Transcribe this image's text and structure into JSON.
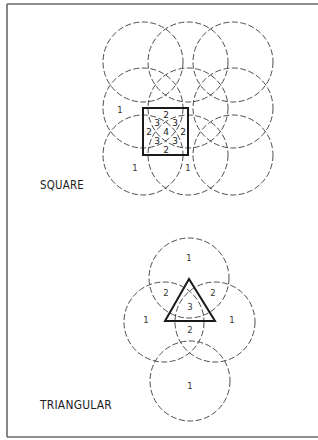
{
  "figure": {
    "width": 318,
    "height": 440,
    "frame": {
      "left": 7,
      "top": 4,
      "right": 318,
      "bottom": 437
    },
    "colors": {
      "circle": "#3a3a3a",
      "shape": "#1a1a1a",
      "frame": "#6a6a6a",
      "text": "#1e1e1e"
    }
  },
  "patterns": [
    {
      "id": "square",
      "title": "SQUARE",
      "title_pos": {
        "x": 40,
        "y": 189
      },
      "circle_radius": 40,
      "circles": [
        {
          "cx": 143,
          "cy": 62
        },
        {
          "cx": 188,
          "cy": 62
        },
        {
          "cx": 233,
          "cy": 62
        },
        {
          "cx": 143,
          "cy": 108
        },
        {
          "cx": 188,
          "cy": 108
        },
        {
          "cx": 233,
          "cy": 108
        },
        {
          "cx": 143,
          "cy": 155
        },
        {
          "cx": 188,
          "cy": 155
        },
        {
          "cx": 233,
          "cy": 155
        }
      ],
      "shape": {
        "type": "square",
        "x": 143,
        "y": 108,
        "w": 45,
        "h": 47
      },
      "labels": [
        {
          "text": "1",
          "x": 120,
          "y": 110
        },
        {
          "text": "1",
          "x": 135,
          "y": 168
        },
        {
          "text": "1",
          "x": 188,
          "y": 168
        },
        {
          "text": "2",
          "x": 166,
          "y": 115,
          "inner": true
        },
        {
          "text": "2",
          "x": 166,
          "y": 150,
          "inner": true
        },
        {
          "text": "2",
          "x": 149,
          "y": 132,
          "inner": true
        },
        {
          "text": "2",
          "x": 183,
          "y": 132,
          "inner": true
        },
        {
          "text": "3",
          "x": 157,
          "y": 123,
          "inner": true
        },
        {
          "text": "3",
          "x": 175,
          "y": 123,
          "inner": true
        },
        {
          "text": "3",
          "x": 157,
          "y": 141,
          "inner": true
        },
        {
          "text": "3",
          "x": 175,
          "y": 141,
          "inner": true
        },
        {
          "text": "4",
          "x": 166,
          "y": 132,
          "inner": true
        }
      ]
    },
    {
      "id": "triangular",
      "title": "TRIANGULAR",
      "title_pos": {
        "x": 40,
        "y": 409
      },
      "circle_radius": 40,
      "circles": [
        {
          "cx": 189,
          "cy": 278
        },
        {
          "cx": 164,
          "cy": 322
        },
        {
          "cx": 215,
          "cy": 322
        },
        {
          "cx": 190,
          "cy": 381
        }
      ],
      "shape": {
        "type": "triangle",
        "points": [
          [
            189,
            279
          ],
          [
            165,
            321
          ],
          [
            215,
            321
          ]
        ]
      },
      "labels": [
        {
          "text": "1",
          "x": 189,
          "y": 258
        },
        {
          "text": "1",
          "x": 146,
          "y": 320
        },
        {
          "text": "1",
          "x": 232,
          "y": 320
        },
        {
          "text": "1",
          "x": 190,
          "y": 386
        },
        {
          "text": "2",
          "x": 166,
          "y": 293
        },
        {
          "text": "2",
          "x": 213,
          "y": 293
        },
        {
          "text": "2",
          "x": 190,
          "y": 330
        },
        {
          "text": "3",
          "x": 190,
          "y": 307
        }
      ]
    }
  ]
}
